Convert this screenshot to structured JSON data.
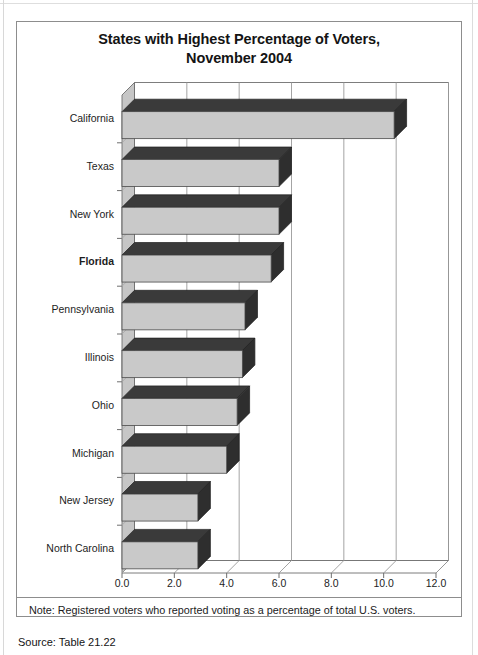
{
  "figure": {
    "title_line1": "States with Highest Percentage of Voters,",
    "title_line2": "November 2004",
    "note": "Note: Registered voters who reported voting as a percentage of total U.S. voters.",
    "source": "Source: Table 21.22"
  },
  "chart_data": {
    "type": "bar",
    "orientation": "horizontal",
    "style": "3d",
    "title": "States with Highest Percentage of Voters, November 2004",
    "xlabel": "",
    "ylabel": "",
    "xlim": [
      0.0,
      12.0
    ],
    "xticks": [
      "0.0",
      "2.0",
      "4.0",
      "6.0",
      "8.0",
      "10.0",
      "12.0"
    ],
    "xtick_values": [
      0.0,
      2.0,
      4.0,
      6.0,
      8.0,
      10.0,
      12.0
    ],
    "grid": true,
    "legend": false,
    "categories": [
      "California",
      "Texas",
      "New York",
      "Florida",
      "Pennsylvania",
      "Illinois",
      "Ohio",
      "Michigan",
      "New Jersey",
      "North Carolina"
    ],
    "highlighted_category": "Florida",
    "values": [
      10.4,
      6.0,
      6.0,
      5.7,
      4.7,
      4.6,
      4.4,
      4.0,
      2.9,
      2.9
    ],
    "colors": {
      "bar_front": "#c9c9c9",
      "bar_top": "#3a3a3a",
      "bar_side": "#2e2e2e",
      "wall": "#ffffff",
      "floor": "#ffffff",
      "left_wall": "#c6c6c6",
      "gridline": "#9a9a9a",
      "axis": "#6e6e6e"
    }
  },
  "axis": {
    "tick_labels": [
      "0.0",
      "2.0",
      "4.0",
      "6.0",
      "8.0",
      "10.0",
      "12.0"
    ]
  }
}
